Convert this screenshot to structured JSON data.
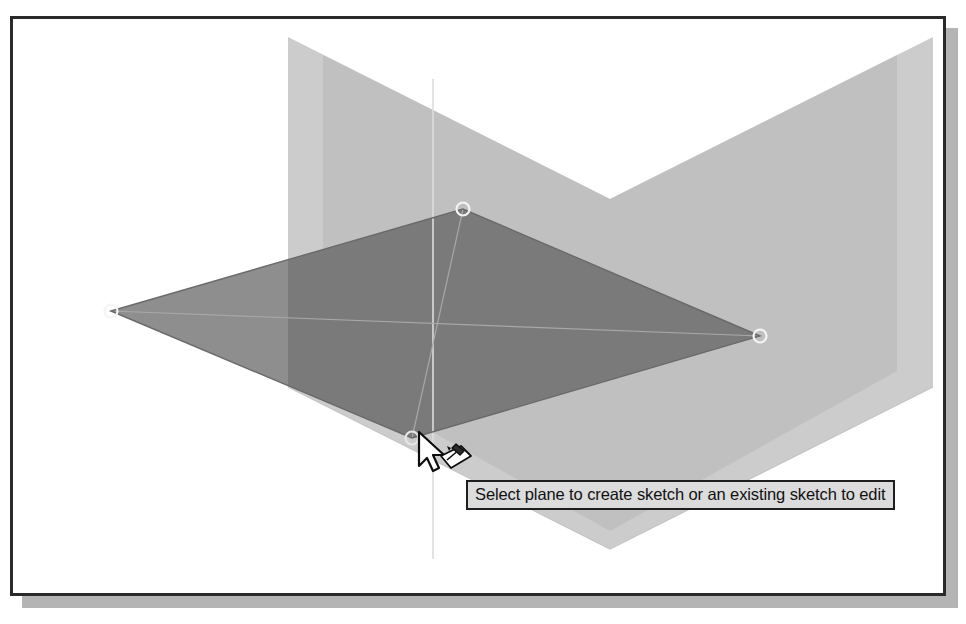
{
  "figure": {
    "kind": "cad-viewport",
    "application_hint": "3D sketch plane picker",
    "background_color": "#ffffff",
    "frame_border_color": "#2a2a2a",
    "shadow_color": "#b4b4b4"
  },
  "tooltip": {
    "text": "Select plane to create sketch or an existing sketch to edit",
    "background_color": "#dcdcdc",
    "border_color": "#1e1e1e",
    "text_color": "#111111"
  },
  "cursor": {
    "kind": "arrow-with-sketch-badge",
    "arrow_fill": "#ffffff",
    "arrow_stroke": "#101010",
    "badge_name": "create-sketch-badge"
  },
  "planes": [
    {
      "name": "horizontal-plane",
      "label": "XY plane",
      "highlighted": true,
      "fill": "#8e8e8e",
      "fill_highlight": "#7a7a7a",
      "edge_color": "#5a5a5a",
      "vertices": [
        {
          "name": "left-handle",
          "x": 108,
          "y": 308
        },
        {
          "name": "top-handle",
          "x": 460,
          "y": 206
        },
        {
          "name": "right-handle",
          "x": 757,
          "y": 333
        },
        {
          "name": "front-handle",
          "x": 409,
          "y": 435
        }
      ]
    },
    {
      "name": "vertical-plane-left",
      "label": "XZ plane",
      "highlighted": false,
      "fill": "#c9c9c9",
      "edge_color": "#b0b0b0"
    },
    {
      "name": "vertical-plane-right",
      "label": "YZ plane",
      "highlighted": false,
      "fill": "#c9c9c9",
      "edge_color": "#b0b0b0"
    }
  ],
  "axes": {
    "vertical_axis_color": "#d8d8d8",
    "diagonal_axis_color": "#9f9f9f"
  },
  "handles": {
    "stroke": "#f2f2f2",
    "radius": 6
  },
  "ghost_text": [
    {
      "id": "g1",
      "text": "Maybe",
      "x": 78,
      "y": 176
    },
    {
      "id": "g2",
      "text": "From",
      "x": 486,
      "y": 170
    },
    {
      "id": "g3",
      "text": "Selecting the sketch plane",
      "x": 470,
      "y": 216
    },
    {
      "id": "g4",
      "text": "The working the",
      "x": 70,
      "y": 250
    },
    {
      "id": "g5",
      "text": "of the plane",
      "x": 80,
      "y": 350
    },
    {
      "id": "g6",
      "text": "sketch",
      "x": 640,
      "y": 432
    },
    {
      "id": "g7",
      "text": "Figure 2. Sketch plane selection with the cursor",
      "x": 66,
      "y": 578
    }
  ]
}
